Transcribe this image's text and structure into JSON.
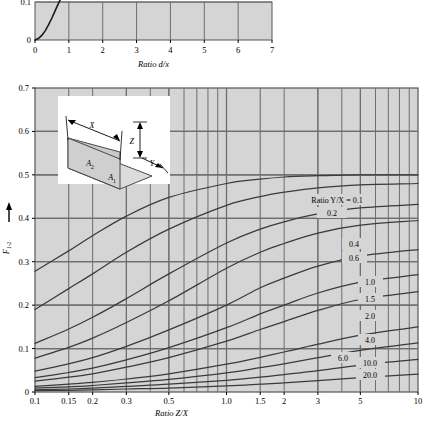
{
  "figure": {
    "title": "",
    "background_color": "#ffffff",
    "plot_background_color": "#d5d5d5",
    "grid_color": "#6e6e6e",
    "curve_color": "#3a3a3a",
    "axis_color": "#555555"
  },
  "top_chart": {
    "xlabel": "Ratio d/x",
    "ylabel": "",
    "xticks": [
      "0",
      "1",
      "2",
      "3",
      "4",
      "5",
      "6",
      "7"
    ],
    "yticks": [
      "0",
      "0.1"
    ]
  },
  "main_chart": {
    "xlabel": "Ratio Z/X",
    "ylabel": "F",
    "ylabel_sub": "1-2",
    "xticks": [
      "0.1",
      "0.15",
      "0.2",
      "0.3",
      "0.5",
      "1.0",
      "1.5",
      "2",
      "3",
      "5",
      "10"
    ],
    "yticks": [
      "0",
      "0.1",
      "0.2",
      "0.3",
      "0.4",
      "0.5",
      "0.6",
      "0.7"
    ],
    "curve_legend_prefix": "Ratio Y/X = ",
    "curve_labels": [
      "0.1",
      "0.2",
      "0.4",
      "0.6",
      "1.0",
      "1.5",
      "2.0",
      "4.0",
      "6.0",
      "10.0",
      "20.0"
    ]
  },
  "inset": {
    "label_x": "X",
    "label_y": "Y",
    "label_z": "Z",
    "label_a1": "A",
    "label_a1_sub": "1",
    "label_a2": "A",
    "label_a2_sub": "2"
  },
  "chart_data": {
    "type": "line",
    "title": "",
    "xlabel": "Ratio Z/X",
    "ylabel": "F(1-2)",
    "xscale": "log",
    "xlim": [
      0.1,
      10
    ],
    "ylim": [
      0,
      0.7
    ],
    "grid": true,
    "legend": "inline-curve-labels",
    "legend_title": "Ratio Y/X",
    "x": [
      0.1,
      0.15,
      0.2,
      0.3,
      0.5,
      1.0,
      1.5,
      2.0,
      3.0,
      5.0,
      10.0
    ],
    "series": [
      {
        "name": "0.1",
        "values": [
          0.278,
          0.325,
          0.36,
          0.405,
          0.448,
          0.48,
          0.49,
          0.495,
          0.498,
          0.5,
          0.5
        ]
      },
      {
        "name": "0.2",
        "values": [
          0.19,
          0.238,
          0.272,
          0.322,
          0.375,
          0.43,
          0.45,
          0.46,
          0.47,
          0.477,
          0.48
        ]
      },
      {
        "name": "0.4",
        "values": [
          0.112,
          0.145,
          0.172,
          0.215,
          0.272,
          0.343,
          0.375,
          0.392,
          0.41,
          0.424,
          0.432
        ]
      },
      {
        "name": "0.6",
        "values": [
          0.078,
          0.103,
          0.124,
          0.16,
          0.21,
          0.285,
          0.322,
          0.342,
          0.366,
          0.384,
          0.395
        ]
      },
      {
        "name": "1.0",
        "values": [
          0.048,
          0.065,
          0.079,
          0.105,
          0.143,
          0.2,
          0.24,
          0.262,
          0.29,
          0.313,
          0.328
        ]
      },
      {
        "name": "1.5",
        "values": [
          0.033,
          0.045,
          0.055,
          0.074,
          0.102,
          0.148,
          0.18,
          0.2,
          0.228,
          0.253,
          0.27
        ]
      },
      {
        "name": "2.0",
        "values": [
          0.025,
          0.034,
          0.042,
          0.057,
          0.079,
          0.117,
          0.144,
          0.162,
          0.188,
          0.213,
          0.231
        ]
      },
      {
        "name": "4.0",
        "values": [
          0.013,
          0.018,
          0.022,
          0.03,
          0.042,
          0.064,
          0.08,
          0.092,
          0.11,
          0.131,
          0.15
        ]
      },
      {
        "name": "6.0",
        "values": [
          0.009,
          0.012,
          0.015,
          0.021,
          0.029,
          0.044,
          0.056,
          0.065,
          0.079,
          0.096,
          0.113
        ]
      },
      {
        "name": "10.0",
        "values": [
          0.005,
          0.007,
          0.009,
          0.013,
          0.018,
          0.027,
          0.034,
          0.04,
          0.049,
          0.062,
          0.075
        ]
      },
      {
        "name": "20.0",
        "values": [
          0.003,
          0.004,
          0.005,
          0.007,
          0.009,
          0.014,
          0.018,
          0.021,
          0.026,
          0.033,
          0.041
        ]
      }
    ],
    "inset_chart": {
      "type": "line",
      "xlabel": "Ratio d/x",
      "ylabel": "",
      "xlim": [
        0,
        7
      ],
      "ylim": [
        0,
        0.1
      ],
      "xticks": [
        0,
        1,
        2,
        3,
        4,
        5,
        6,
        7
      ],
      "yticks": [
        0,
        0.1
      ],
      "x": [
        0,
        0.1,
        0.2,
        0.3,
        0.4,
        0.5,
        0.6,
        0.7,
        0.8
      ],
      "values": [
        0,
        0.004,
        0.012,
        0.024,
        0.04,
        0.058,
        0.078,
        0.098,
        0.115
      ]
    }
  }
}
